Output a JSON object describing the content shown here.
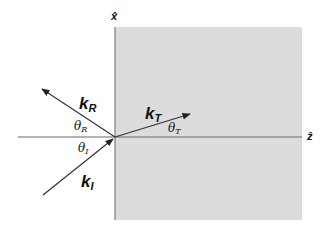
{
  "diagram": {
    "title": "",
    "colors": {
      "medium": "#dcdcdc",
      "line": "#555555",
      "arrow": "#222222"
    },
    "axes": {
      "x_label": "x̂",
      "z_label": "ẑ"
    },
    "vectors": {
      "incident": {
        "label": "k",
        "sub": "I",
        "angle_label": "θ",
        "angle_sub": "I"
      },
      "reflected": {
        "label": "k",
        "sub": "R",
        "angle_label": "θ",
        "angle_sub": "R"
      },
      "transmitted": {
        "label": "k",
        "sub": "T",
        "angle_label": "θ",
        "angle_sub": "T"
      }
    }
  }
}
